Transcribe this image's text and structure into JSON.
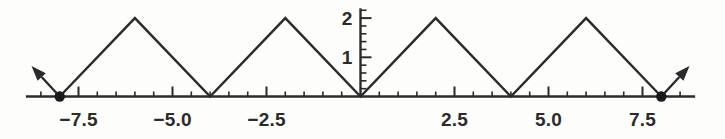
{
  "chart_data": {
    "type": "line",
    "title": "",
    "subtitle": "",
    "xlabel": "",
    "ylabel": "",
    "xlim": [
      -8.9,
      8.9
    ],
    "ylim": [
      0,
      2.25
    ],
    "grid": false,
    "legend_position": "none",
    "series": [
      {
        "name": "triangle-wave",
        "x": [
          -8,
          -6,
          -4,
          -2,
          0,
          2,
          4,
          6,
          8
        ],
        "y": [
          0,
          2,
          0,
          2,
          0,
          2,
          0,
          2,
          0
        ]
      }
    ],
    "x_tick_labels": [
      "-7.5",
      "-5.0",
      "-2.5",
      "2.5",
      "5.0",
      "7.5"
    ],
    "x_tick_values": [
      -7.5,
      -5.0,
      -2.5,
      2.5,
      5.0,
      7.5
    ],
    "x_minor_step": 0.5,
    "x_minor_range": [
      -8.5,
      8.5
    ],
    "y_tick_labels": [
      "1",
      "2"
    ],
    "y_tick_values": [
      1,
      2
    ],
    "y_minor_step": 0.2,
    "y_minor_max": 2.2,
    "endpoint_markers": [
      {
        "name": "left-endpoint-dot",
        "x": -8,
        "y": 0
      },
      {
        "name": "right-endpoint-dot",
        "x": 8,
        "y": 0
      }
    ],
    "continuation_arrows": [
      {
        "name": "left-continuation-arrow",
        "from_x": -8,
        "from_y": 0,
        "to_x": -8.75,
        "to_y": 0.78
      },
      {
        "name": "right-continuation-arrow",
        "from_x": 8,
        "from_y": 0,
        "to_x": 8.75,
        "to_y": 0.78
      }
    ],
    "colors": {
      "curve": "#2b2b2b",
      "axis": "#2b2b2b",
      "tick": "#2b2b2b",
      "text": "#2b2b2b",
      "background": "#fdfdfc",
      "marker": "#1a1a1a"
    },
    "stroke_widths": {
      "curve": 2.4,
      "axis": 2.4,
      "major_tick": 2.0,
      "minor_tick": 1.6
    }
  }
}
